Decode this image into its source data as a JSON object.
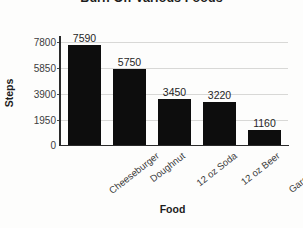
{
  "chart_data": {
    "type": "bar",
    "title": "Burn Off Various Foods",
    "xlabel": "Food",
    "ylabel": "Steps",
    "categories": [
      "Cheeseburger",
      "Doughnut",
      "12 oz Soda",
      "12 oz Beer",
      "Garden Salad"
    ],
    "values": [
      7590,
      5750,
      3450,
      3220,
      1160
    ],
    "value_labels": [
      "7590",
      "5750",
      "3450",
      "3220",
      "1160"
    ],
    "ylim": [
      0,
      7800
    ],
    "yticks": [
      7800,
      5850,
      3900,
      1950,
      0
    ],
    "ytick_labels": [
      "7800",
      "5850",
      "3900",
      "1950",
      "0"
    ],
    "grid": "horizontal",
    "legend": "none",
    "bar_color": "#0d0d0d",
    "gridline_color": "#d8d8d6",
    "axis_color": "#2a2a2a",
    "background_color": "#fdfdfc"
  }
}
